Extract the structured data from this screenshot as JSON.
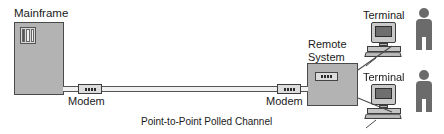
{
  "diagram": {
    "caption": "Point-to-Point Polled Channel",
    "nodes": {
      "mainframe": {
        "label": "Mainframe"
      },
      "modem_left": {
        "label": "Modem"
      },
      "modem_right": {
        "label": "Modem"
      },
      "remote_system": {
        "label": "Remote System"
      },
      "terminal_top": {
        "label": "Terminal"
      },
      "terminal_bottom": {
        "label": "Terminal"
      }
    },
    "colors": {
      "cabinet_fill": "#b3b3b3",
      "outline": "#4a4a4a",
      "device_fill": "#dcdcdc",
      "screen": "#6f6f6f",
      "person": "#6b6b6b",
      "background": "#ffffff",
      "text": "#1a1a1a"
    }
  }
}
